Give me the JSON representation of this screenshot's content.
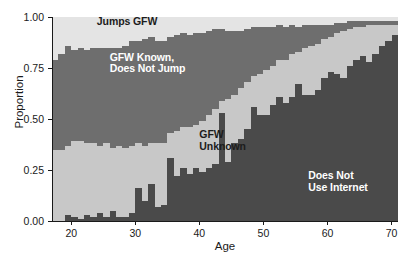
{
  "chart_data": {
    "type": "area",
    "title": "",
    "subtitle": "",
    "xlabel": "Age",
    "ylabel": "Proportion",
    "xlim": [
      17,
      71
    ],
    "ylim": [
      0,
      1
    ],
    "xticks": [
      20,
      30,
      40,
      50,
      60,
      70
    ],
    "xticklabels": [
      "20",
      "30",
      "40",
      "50",
      "60",
      "70"
    ],
    "yticks": [
      0.0,
      0.25,
      0.5,
      0.75,
      1.0
    ],
    "yticklabels": [
      "0.00",
      "0.25",
      "0.50",
      "0.75",
      "1.00"
    ],
    "grid": false,
    "legend_position": "inline-annotations",
    "stacking": "normalized-to-1",
    "stack_order_bottom_to_top": [
      "Does Not Use Internet",
      "GFW Unknown",
      "GFW Known, Does Not Jump",
      "Jumps GFW"
    ],
    "colors": {
      "does_not_use_internet": "#4a4a4a",
      "gfw_unknown": "#c8c8c8",
      "gfw_known_does_not_jump": "#6e6e6e",
      "jumps_gfw": "#e4e4e4",
      "axis": "#1a1a1a",
      "background": "#ffffff"
    },
    "annotations": [
      {
        "text": "Jumps GFW",
        "series": "Jumps GFW",
        "x": 24,
        "y": 0.975,
        "color": "#1c1c1c"
      },
      {
        "text": "GFW Known,\nDoes Not Jump",
        "series": "GFW Known, Does Not Jump",
        "x": 26,
        "y": 0.8,
        "color": "#ffffff"
      },
      {
        "text": "GFW\nUnknown",
        "series": "GFW Unknown",
        "x": 40,
        "y": 0.42,
        "color": "#1c1c1c"
      },
      {
        "text": "Does Not\nUse Internet",
        "series": "Does Not Use Internet",
        "x": 57,
        "y": 0.22,
        "color": "#ffffff"
      }
    ],
    "x": [
      17,
      18,
      19,
      20,
      21,
      22,
      23,
      24,
      25,
      26,
      27,
      28,
      29,
      30,
      31,
      32,
      33,
      34,
      35,
      36,
      37,
      38,
      39,
      40,
      41,
      42,
      43,
      44,
      45,
      46,
      47,
      48,
      49,
      50,
      51,
      52,
      53,
      54,
      55,
      56,
      57,
      58,
      59,
      60,
      61,
      62,
      63,
      64,
      65,
      66,
      67,
      68,
      69,
      70
    ],
    "series": [
      {
        "name": "Does Not Use Internet",
        "values": [
          0.0,
          0.0,
          0.03,
          0.02,
          0.01,
          0.03,
          0.02,
          0.04,
          0.02,
          0.05,
          0.02,
          0.02,
          0.04,
          0.16,
          0.1,
          0.18,
          0.07,
          0.08,
          0.31,
          0.22,
          0.26,
          0.23,
          0.26,
          0.24,
          0.26,
          0.28,
          0.53,
          0.29,
          0.38,
          0.4,
          0.45,
          0.56,
          0.52,
          0.52,
          0.57,
          0.61,
          0.58,
          0.61,
          0.67,
          0.62,
          0.62,
          0.64,
          0.7,
          0.73,
          0.72,
          0.7,
          0.76,
          0.79,
          0.81,
          0.78,
          0.82,
          0.86,
          0.88,
          0.91
        ]
      },
      {
        "name": "GFW Unknown",
        "values": [
          0.35,
          0.35,
          0.34,
          0.37,
          0.38,
          0.35,
          0.36,
          0.33,
          0.36,
          0.31,
          0.35,
          0.34,
          0.33,
          0.22,
          0.27,
          0.2,
          0.31,
          0.3,
          0.12,
          0.22,
          0.2,
          0.23,
          0.21,
          0.25,
          0.26,
          0.27,
          0.06,
          0.31,
          0.24,
          0.25,
          0.23,
          0.15,
          0.2,
          0.22,
          0.19,
          0.18,
          0.21,
          0.21,
          0.16,
          0.23,
          0.24,
          0.23,
          0.19,
          0.17,
          0.2,
          0.23,
          0.18,
          0.16,
          0.14,
          0.18,
          0.14,
          0.1,
          0.08,
          0.05
        ]
      },
      {
        "name": "GFW Known, Does Not Jump",
        "values": [
          0.44,
          0.47,
          0.49,
          0.45,
          0.46,
          0.46,
          0.47,
          0.48,
          0.47,
          0.49,
          0.48,
          0.5,
          0.51,
          0.5,
          0.52,
          0.52,
          0.5,
          0.5,
          0.47,
          0.47,
          0.46,
          0.45,
          0.45,
          0.43,
          0.41,
          0.39,
          0.35,
          0.33,
          0.31,
          0.28,
          0.26,
          0.24,
          0.23,
          0.21,
          0.19,
          0.17,
          0.16,
          0.14,
          0.12,
          0.11,
          0.1,
          0.09,
          0.07,
          0.06,
          0.05,
          0.04,
          0.04,
          0.03,
          0.03,
          0.02,
          0.02,
          0.02,
          0.02,
          0.02
        ]
      },
      {
        "name": "Jumps GFW",
        "values": [
          0.21,
          0.18,
          0.14,
          0.16,
          0.15,
          0.16,
          0.15,
          0.15,
          0.15,
          0.15,
          0.15,
          0.14,
          0.12,
          0.12,
          0.11,
          0.1,
          0.12,
          0.12,
          0.1,
          0.09,
          0.08,
          0.09,
          0.08,
          0.08,
          0.07,
          0.06,
          0.06,
          0.07,
          0.07,
          0.07,
          0.06,
          0.05,
          0.05,
          0.05,
          0.05,
          0.04,
          0.05,
          0.04,
          0.05,
          0.04,
          0.04,
          0.04,
          0.04,
          0.04,
          0.03,
          0.03,
          0.02,
          0.02,
          0.02,
          0.02,
          0.02,
          0.02,
          0.02,
          0.02
        ]
      }
    ]
  }
}
